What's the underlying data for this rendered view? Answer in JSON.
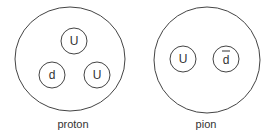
{
  "particles": [
    {
      "name": "proton",
      "label": "proton",
      "quarks": [
        {
          "label": "U",
          "antiquark": false
        },
        {
          "label": "d",
          "antiquark": false
        },
        {
          "label": "U",
          "antiquark": false
        }
      ]
    },
    {
      "name": "pion",
      "label": "pion",
      "quarks": [
        {
          "label": "U",
          "antiquark": false
        },
        {
          "label": "d",
          "antiquark": true
        }
      ]
    }
  ],
  "colors": {
    "stroke": "#444444",
    "text": "#333333",
    "background": "#ffffff"
  }
}
